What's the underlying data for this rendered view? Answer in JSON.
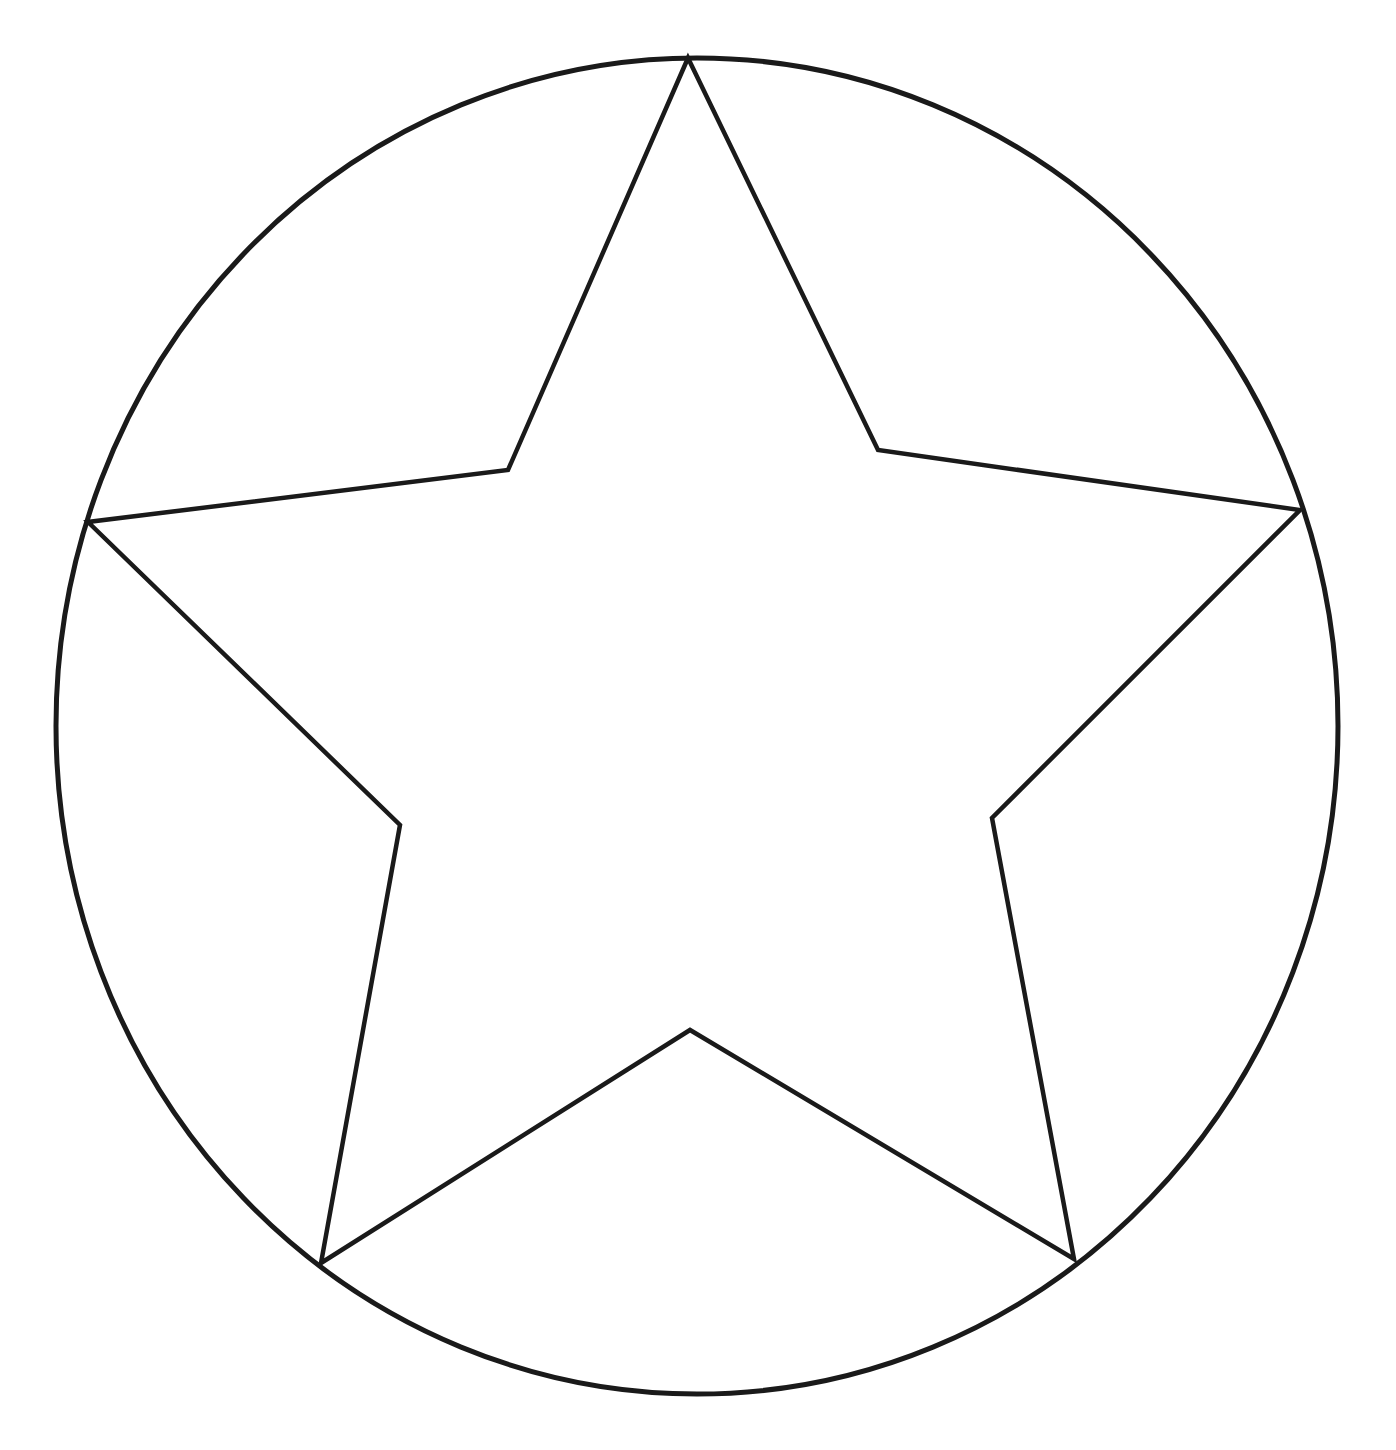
{
  "canvas": {
    "width": 1396,
    "height": 1450,
    "background_color": "#ffffff",
    "description": "Black line-art outline drawing: a five-pointed star inscribed in a circle, on a plain white background. No text, labels, or UI chrome are present."
  },
  "style": {
    "stroke_color": "#1a1a1a",
    "stroke_width_circle": 5,
    "stroke_width_star": 4.5,
    "fill": "none"
  },
  "figure": {
    "shapes": [
      {
        "name": "circle-outline",
        "type": "ellipse",
        "center_x": 697,
        "center_y": 726,
        "radius_x": 641,
        "radius_y": 668,
        "stroke_color": "#1a1a1a",
        "stroke_width": 5
      },
      {
        "name": "star-outline",
        "type": "polygon",
        "points_label": "five-pointed star, outer tips touching the circle",
        "stroke_color": "#1a1a1a",
        "stroke_width": 4.5,
        "outer_points": [
          {
            "name": "tip-top",
            "x": 688,
            "y": 58
          },
          {
            "name": "tip-right",
            "x": 1300,
            "y": 510
          },
          {
            "name": "tip-bottom-right",
            "x": 1074,
            "y": 1259
          },
          {
            "name": "tip-bottom-left",
            "x": 321,
            "y": 1263
          },
          {
            "name": "tip-left",
            "x": 88,
            "y": 522
          }
        ],
        "inner_points": [
          {
            "name": "notch-upper-right",
            "x": 878,
            "y": 450
          },
          {
            "name": "notch-right",
            "x": 992,
            "y": 818
          },
          {
            "name": "notch-bottom",
            "x": 690,
            "y": 1030
          },
          {
            "name": "notch-left",
            "x": 400,
            "y": 825
          },
          {
            "name": "notch-upper-left",
            "x": 508,
            "y": 470
          }
        ],
        "path": "M 688 58 L 878 450 L 1300 510 L 992 818 L 1074 1259 L 690 1030 L 321 1263 L 400 825 L 88 522 L 508 470 Z"
      }
    ]
  }
}
